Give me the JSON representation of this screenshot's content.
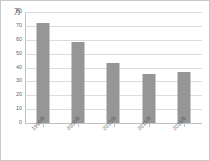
{
  "chart_data": {
    "type": "bar",
    "title": "",
    "subtitle": "",
    "xlabel": "",
    "ylabel": "万",
    "unit_label": "万",
    "categories": [
      "1990年",
      "2000年",
      "2010年",
      "2015年",
      "2016年"
    ],
    "values": [
      72,
      58.5,
      43,
      35,
      36.5
    ],
    "series": [
      {
        "name": "",
        "values": [
          72,
          58.5,
          43,
          35,
          36.5
        ]
      }
    ],
    "ylim": [
      0,
      80
    ],
    "ytick_values": [
      80,
      70,
      60,
      50,
      40,
      30,
      20,
      10,
      0
    ],
    "ytick_labels": [
      "80",
      "70",
      "60",
      "50",
      "40",
      "30",
      "20",
      "10",
      "0"
    ],
    "ytick_interval": 10,
    "grid": true,
    "grid_axis": "y",
    "legend": false,
    "legend_position": "none",
    "xtick_rotation": -45,
    "colors": {
      "bar": "#969696",
      "gridline": "#dcdcdc",
      "axis": "#c0c0c0",
      "tick_text": "#666666",
      "unit_text": "#555555",
      "background": "#ffffff",
      "frame_border": "#c8c8c8"
    }
  }
}
